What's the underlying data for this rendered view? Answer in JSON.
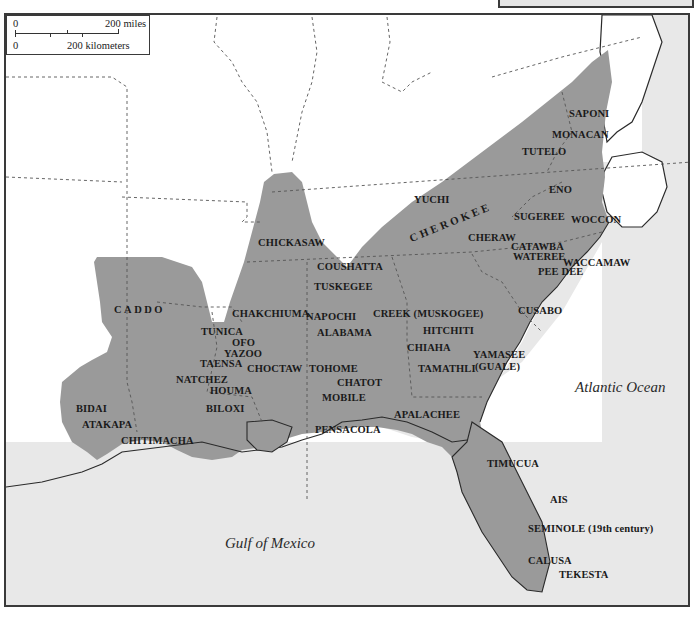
{
  "map": {
    "colors": {
      "land_territory": "#9a9a9a",
      "land_other": "#ffffff",
      "water": "#e8e8e8",
      "border": "#3a3a3a",
      "state_lines": "#555555"
    },
    "scale_bar": {
      "miles_zero": "0",
      "miles_label": "200 miles",
      "km_zero": "0",
      "km_label": "200 kilometers"
    },
    "water_bodies": {
      "atlantic": "Atlantic Ocean",
      "gulf": "Gulf of Mexico"
    },
    "tribes": [
      {
        "name": "SAPONI"
      },
      {
        "name": "MONACAN"
      },
      {
        "name": "TUTELO"
      },
      {
        "name": "ENO"
      },
      {
        "name": "YUCHI"
      },
      {
        "name": "SUGEREE"
      },
      {
        "name": "WOCCON"
      },
      {
        "name": "CHEROKEE"
      },
      {
        "name": "CHERAW"
      },
      {
        "name": "CATAWBA"
      },
      {
        "name": "WATEREE"
      },
      {
        "name": "WACCAMAW"
      },
      {
        "name": "PEE DEE"
      },
      {
        "name": "CHICKASAW"
      },
      {
        "name": "COUSHATTA"
      },
      {
        "name": "TUSKEGEE"
      },
      {
        "name": "CADDO"
      },
      {
        "name": "CHAKCHIUMA"
      },
      {
        "name": "NAPOCHI"
      },
      {
        "name": "ALABAMA"
      },
      {
        "name": "CREEK (MUSKOGEE)"
      },
      {
        "name": "HITCHITI"
      },
      {
        "name": "CUSABO"
      },
      {
        "name": "TUNICA"
      },
      {
        "name": "OFO"
      },
      {
        "name": "YAZOO"
      },
      {
        "name": "TAENSA"
      },
      {
        "name": "NATCHEZ"
      },
      {
        "name": "CHOCTAW"
      },
      {
        "name": "HOUMA"
      },
      {
        "name": "TOHOME"
      },
      {
        "name": "CHIAHA"
      },
      {
        "name": "TAMATHLI"
      },
      {
        "name": "YAMASEE"
      },
      {
        "name": "(GUALE)"
      },
      {
        "name": "CHATOT"
      },
      {
        "name": "BIDAI"
      },
      {
        "name": "MOBILE"
      },
      {
        "name": "BILOXI"
      },
      {
        "name": "ATAKAPA"
      },
      {
        "name": "APALACHEE"
      },
      {
        "name": "PENSACOLA"
      },
      {
        "name": "CHITIMACHA"
      },
      {
        "name": "TIMUCUA"
      },
      {
        "name": "AIS"
      },
      {
        "name": "SEMINOLE (19th century)"
      },
      {
        "name": "CALUSA"
      },
      {
        "name": "TEKESTA"
      }
    ]
  }
}
